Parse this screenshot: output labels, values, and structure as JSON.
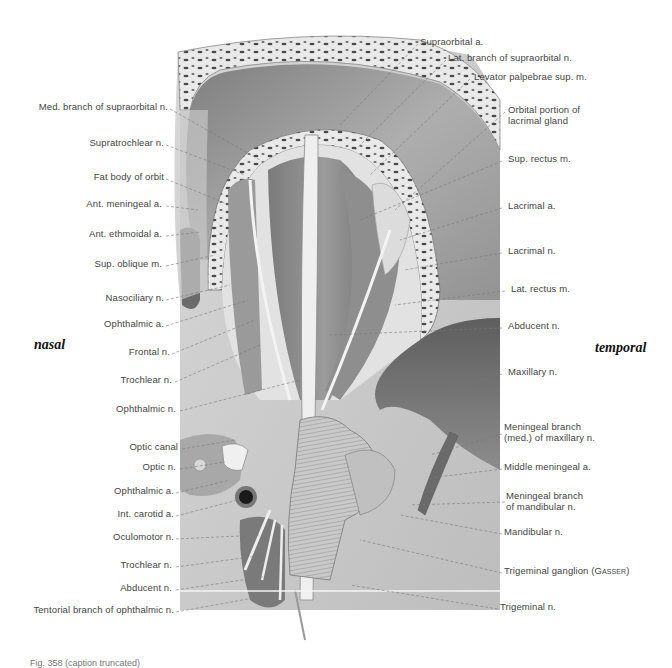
{
  "figure": {
    "orientation": {
      "left": "nasal",
      "right": "temporal"
    },
    "labels_left": [
      {
        "text": "Med. branch of supraorbital n.",
        "y": 106
      },
      {
        "text": "Supratrochlear n.",
        "y": 142
      },
      {
        "text": "Fat body of orbit",
        "y": 176
      },
      {
        "text": "Ant. meningeal a.",
        "y": 203
      },
      {
        "text": "Ant. ethmoidal a.",
        "y": 233
      },
      {
        "text": "Sup. oblique m.",
        "y": 263
      },
      {
        "text": "Nasociliary n.",
        "y": 297
      },
      {
        "text": "Ophthalmic a.",
        "y": 323
      },
      {
        "text": "Frontal n.",
        "y": 351
      },
      {
        "text": "Trochlear n.",
        "y": 379
      },
      {
        "text": "Ophthalmic n.",
        "y": 408
      },
      {
        "text": "Optic canal",
        "y": 446
      },
      {
        "text": "Optic n.",
        "y": 466
      },
      {
        "text": "Ophthalmic a.",
        "y": 490
      },
      {
        "text": "Int. carotid a.",
        "y": 513
      },
      {
        "text": "Oculomotor n.",
        "y": 536
      },
      {
        "text": "Trochlear n.",
        "y": 564
      },
      {
        "text": "Abducent n.",
        "y": 587
      },
      {
        "text": "Tentorial branch of ophthalmic n.",
        "y": 609
      }
    ],
    "labels_right": [
      {
        "text": "Supraorbital a.",
        "y": 41
      },
      {
        "text": "Lat. branch of supraorbital n.",
        "y": 57
      },
      {
        "text": "Levator palpebrae sup. m.",
        "y": 76
      },
      {
        "text": "Orbital portion of",
        "text2": "lacrimal gland",
        "y": 106
      },
      {
        "text": "Sup. rectus m.",
        "y": 158
      },
      {
        "text": "Lacrimal a.",
        "y": 205
      },
      {
        "text": "Lacrimal n.",
        "y": 250
      },
      {
        "text": "Lat. rectus m.",
        "y": 288
      },
      {
        "text": "Abducent n.",
        "y": 325
      },
      {
        "text": "Maxillary n.",
        "y": 371
      },
      {
        "text": "Meningeal branch",
        "text2": "(med.) of maxillary n.",
        "y": 426
      },
      {
        "text": "Middle meningeal a.",
        "y": 466
      },
      {
        "text": "Meningeal branch",
        "text2": "of mandibular n.",
        "y": 494
      },
      {
        "text": "Mandibular n.",
        "y": 531
      },
      {
        "text": "Trigeminal ganglion",
        "text_sc": "(Gasser)",
        "y": 570
      },
      {
        "text": "Trigeminal n.",
        "y": 606
      }
    ],
    "caption": "Fig. 358  (caption truncated)"
  }
}
